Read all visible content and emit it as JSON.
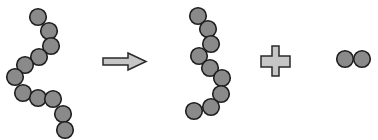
{
  "diagram": {
    "colors": {
      "bead_fill": "#8a8a8a",
      "bead_stroke": "#1e1e1e",
      "symbol_fill": "#c6c6c6",
      "symbol_stroke": "#2a2a2a",
      "background": "#ffffff"
    },
    "bead_radius": 8.3,
    "reactant_chain": {
      "label": "11-bead chain",
      "beads": [
        [
          38,
          17
        ],
        [
          49,
          31
        ],
        [
          51,
          46
        ],
        [
          39,
          57
        ],
        [
          25,
          65
        ],
        [
          15,
          77
        ],
        [
          23,
          93
        ],
        [
          38,
          98
        ],
        [
          53,
          99
        ],
        [
          63,
          114
        ],
        [
          65,
          130
        ]
      ]
    },
    "arrow": {
      "label": "yields",
      "icon": "right-arrow-icon"
    },
    "product_chain": {
      "label": "9-bead chain",
      "beads": [
        [
          198,
          16
        ],
        [
          208,
          29
        ],
        [
          211,
          44
        ],
        [
          199,
          56
        ],
        [
          210,
          68
        ],
        [
          222,
          78
        ],
        [
          221,
          94
        ],
        [
          211,
          107
        ],
        [
          194,
          111
        ]
      ]
    },
    "plus": {
      "label": "plus",
      "icon": "plus-icon"
    },
    "product_pair": {
      "label": "2-bead pair",
      "beads": [
        [
          345,
          59
        ],
        [
          362,
          59
        ]
      ]
    }
  }
}
